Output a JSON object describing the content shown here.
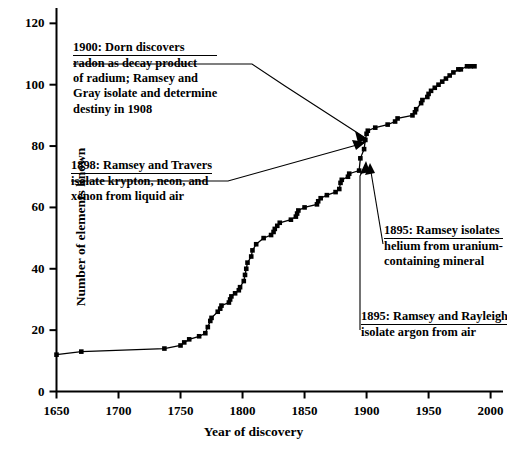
{
  "chart_data": {
    "type": "line",
    "title": "",
    "xlabel": "Year of discovery",
    "ylabel": "Number of elements known",
    "xlim": [
      1650,
      2010
    ],
    "ylim": [
      0,
      125
    ],
    "xticks": [
      1650,
      1700,
      1750,
      1800,
      1850,
      1900,
      1950,
      2000
    ],
    "yticks": [
      0,
      20,
      40,
      60,
      80,
      100,
      120
    ],
    "grid": false,
    "legend": null,
    "marker": "filled-square",
    "series": [
      {
        "name": "Cumulative elements known",
        "x": [
          1650,
          1670,
          1737,
          1750,
          1753,
          1757,
          1765,
          1770,
          1772,
          1774,
          1775,
          1780,
          1782,
          1783,
          1789,
          1790,
          1791,
          1794,
          1797,
          1798,
          1801,
          1802,
          1803,
          1804,
          1807,
          1808,
          1811,
          1817,
          1823,
          1825,
          1826,
          1828,
          1830,
          1839,
          1843,
          1844,
          1845,
          1850,
          1860,
          1861,
          1863,
          1868,
          1875,
          1878,
          1879,
          1880,
          1885,
          1886,
          1894,
          1895,
          1898,
          1899,
          1900,
          1901,
          1907,
          1917,
          1923,
          1925,
          1937,
          1939,
          1940,
          1944,
          1945,
          1949,
          1950,
          1952,
          1955,
          1958,
          1961,
          1964,
          1967,
          1970,
          1974,
          1976,
          1981,
          1984,
          1987
        ],
        "y": [
          12,
          13,
          14,
          15,
          16,
          17,
          18,
          19,
          21,
          23,
          24,
          26,
          27,
          28,
          29,
          30,
          31,
          32,
          33,
          34,
          36,
          38,
          40,
          42,
          44,
          46,
          48,
          50,
          51,
          52,
          53,
          54,
          55,
          56,
          57,
          58,
          59,
          60,
          61,
          62,
          63,
          64,
          65,
          66,
          68,
          69,
          70,
          71,
          72,
          76,
          79,
          82,
          84,
          85,
          86,
          87,
          88,
          89,
          90,
          91,
          92,
          94,
          95,
          96,
          97,
          98,
          99,
          100,
          101,
          102,
          103,
          104,
          105,
          105,
          106,
          106,
          106
        ]
      }
    ],
    "annotations": [
      {
        "id": "ann-1900-dorn",
        "head": "1900: Dorn discovers",
        "lines": [
          "radon as decay product",
          "of  radium; Ramsey and",
          "Gray isolate  and determine",
          "destiny in  1908"
        ],
        "target_x": 1904,
        "target_y": 85
      },
      {
        "id": "ann-1898-ramsey-travers",
        "head": "1898: Ramsey and Travers",
        "lines": [
          "isolate  krypton,  neon, and",
          "xenon  from liquid air"
        ],
        "target_x": 1903,
        "target_y": 83
      },
      {
        "id": "ann-1895-helium",
        "head": "1895: Ramsey isolates",
        "lines": [
          "helium from uranium-",
          "containing  mineral"
        ],
        "target_x": 1900,
        "target_y": 78
      },
      {
        "id": "ann-1895-argon",
        "head": "1895: Ramsey and Rayleigh",
        "lines": [
          "isolate argon from air"
        ],
        "target_x": 1899,
        "target_y": 77
      }
    ]
  },
  "axes": {
    "ylabel": "Number of elements known",
    "xlabel": "Year of discovery",
    "ytick_labels": [
      "120",
      "100",
      "80",
      "60",
      "40",
      "20",
      "0"
    ],
    "xtick_labels": [
      "1650",
      "1700",
      "1750",
      "1800",
      "1850",
      "1900",
      "1950",
      "2000"
    ]
  },
  "annotations": {
    "dorn": {
      "head": "1900: Dorn discovers",
      "l1": "radon as decay product",
      "l2": "of  radium; Ramsey and",
      "l3": "Gray isolate  and determine",
      "l4": "destiny in  1908"
    },
    "travers": {
      "head": "1898: Ramsey and Travers",
      "l1": "isolate  krypton,  neon, and",
      "l2": "xenon  from liquid air"
    },
    "helium": {
      "head": "1895: Ramsey isolates",
      "l1": "helium from uranium-",
      "l2": "containing  mineral"
    },
    "argon": {
      "head": "1895: Ramsey and Rayleigh",
      "l1": "isolate argon from air"
    }
  },
  "style": {
    "line_color": "#000000",
    "marker_color": "#000000",
    "axis_color": "#000000",
    "background": "#ffffff"
  }
}
